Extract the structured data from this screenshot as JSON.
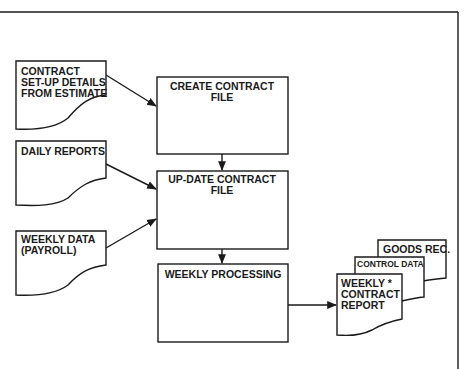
{
  "diagram": {
    "type": "flowchart",
    "inputs": [
      {
        "id": "contract-setup",
        "lines": [
          "CONTRACT",
          "SET-UP DETAILS",
          "FROM ESTIMATE"
        ],
        "shape": "document"
      },
      {
        "id": "daily-reports",
        "lines": [
          "DAILY REPORTS"
        ],
        "shape": "document"
      },
      {
        "id": "weekly-data",
        "lines": [
          "WEEKLY DATA",
          "(PAYROLL)"
        ],
        "shape": "document"
      }
    ],
    "processes": [
      {
        "id": "create-contract-file",
        "lines": [
          "CREATE CONTRACT",
          "FILE"
        ],
        "shape": "rectangle"
      },
      {
        "id": "update-contract-file",
        "lines": [
          "UP-DATE CONTRACT",
          "FILE"
        ],
        "shape": "rectangle"
      },
      {
        "id": "weekly-processing",
        "lines": [
          "WEEKLY PROCESSING"
        ],
        "shape": "rectangle"
      }
    ],
    "outputs": [
      {
        "id": "goods-rec",
        "lines": [
          "GOODS REC."
        ],
        "shape": "document"
      },
      {
        "id": "control-data",
        "lines": [
          "CONTROL DATA"
        ],
        "shape": "document"
      },
      {
        "id": "weekly-contract-report",
        "lines": [
          "WEEKLY *",
          "CONTRACT",
          "REPORT"
        ],
        "shape": "document"
      }
    ],
    "edges": [
      {
        "from": "contract-setup",
        "to": "create-contract-file"
      },
      {
        "from": "create-contract-file",
        "to": "update-contract-file"
      },
      {
        "from": "daily-reports",
        "to": "update-contract-file"
      },
      {
        "from": "weekly-data",
        "to": "update-contract-file"
      },
      {
        "from": "update-contract-file",
        "to": "weekly-processing"
      },
      {
        "from": "weekly-processing",
        "to": "weekly-contract-report"
      }
    ]
  }
}
